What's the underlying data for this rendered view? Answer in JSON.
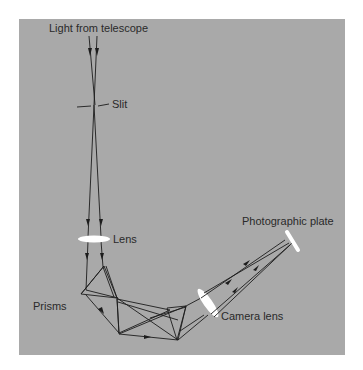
{
  "figure": {
    "background_color": "#a9a9a9",
    "labels": {
      "light_source": "Light from telescope",
      "slit": "Slit",
      "lens": "Lens",
      "prisms": "Prisms",
      "camera_lens": "Camera lens",
      "plate": "Photographic plate"
    },
    "components": [
      "telescope-input",
      "slit",
      "collimator-lens",
      "prism-1",
      "prism-2",
      "prism-3",
      "camera-lens",
      "photographic-plate"
    ]
  }
}
